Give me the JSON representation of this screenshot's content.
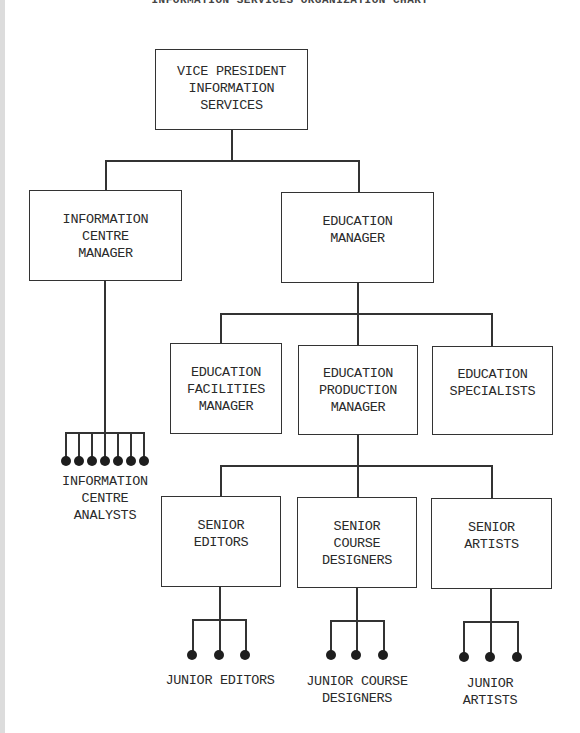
{
  "title": "INFORMATION SERVICES ORGANIZATION CHART",
  "colors": {
    "line": "#333333",
    "background": "#ffffff",
    "binding": "#dcdcdc"
  },
  "nodes": {
    "vp": {
      "label": "VICE PRESIDENT\nINFORMATION\nSERVICES"
    },
    "ic_manager": {
      "label": "INFORMATION\nCENTRE\nMANAGER"
    },
    "ed_manager": {
      "label": "EDUCATION\nMANAGER"
    },
    "ed_facilities": {
      "label": "EDUCATION\nFACILITIES\nMANAGER"
    },
    "ed_production": {
      "label": "EDUCATION\nPRODUCTION\nMANAGER"
    },
    "ed_specialists": {
      "label": "EDUCATION\nSPECIALISTS"
    },
    "senior_editors": {
      "label": "SENIOR\nEDITORS"
    },
    "senior_course_designers": {
      "label": "SENIOR\nCOURSE\nDESIGNERS"
    },
    "senior_artists": {
      "label": "SENIOR\nARTISTS"
    }
  },
  "groups": {
    "ic_analysts": {
      "label": "INFORMATION\nCENTRE\nANALYSTS",
      "count": 7
    },
    "junior_editors": {
      "label": "JUNIOR EDITORS",
      "count": 3
    },
    "junior_course_designers": {
      "label": "JUNIOR COURSE\nDESIGNERS",
      "count": 3
    },
    "junior_artists": {
      "label": "JUNIOR\nARTISTS",
      "count": 3
    }
  },
  "edges": [
    [
      "vp",
      "ic_manager"
    ],
    [
      "vp",
      "ed_manager"
    ],
    [
      "ic_manager",
      "ic_analysts"
    ],
    [
      "ed_manager",
      "ed_facilities"
    ],
    [
      "ed_manager",
      "ed_production"
    ],
    [
      "ed_manager",
      "ed_specialists"
    ],
    [
      "ed_production",
      "senior_editors"
    ],
    [
      "ed_production",
      "senior_course_designers"
    ],
    [
      "ed_production",
      "senior_artists"
    ],
    [
      "senior_editors",
      "junior_editors"
    ],
    [
      "senior_course_designers",
      "junior_course_designers"
    ],
    [
      "senior_artists",
      "junior_artists"
    ]
  ]
}
